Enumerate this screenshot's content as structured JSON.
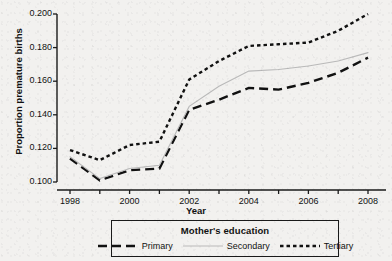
{
  "chart_data": {
    "type": "line",
    "title": "",
    "xlabel": "Year",
    "ylabel": "Proportion premature births",
    "x": [
      1998,
      1999,
      2000,
      2001,
      2002,
      2003,
      2004,
      2005,
      2006,
      2007,
      2008
    ],
    "xtick_labels": [
      "1998",
      "2000",
      "2002",
      "2004",
      "2006",
      "2008"
    ],
    "xticks_major": [
      1998,
      2000,
      2002,
      2004,
      2006,
      2008
    ],
    "xticks_minor": [
      1999,
      2001,
      2003,
      2005,
      2007
    ],
    "xlim": [
      1998,
      2008
    ],
    "ytick_labels": [
      "0.100",
      "0.120",
      "0.140",
      "0.160",
      "0.180",
      "0.200"
    ],
    "yticks": [
      0.1,
      0.12,
      0.14,
      0.16,
      0.18,
      0.2
    ],
    "ylim": [
      0.1,
      0.2
    ],
    "grid": false,
    "legend_position": "below-axis",
    "legend_title": "Mother's education",
    "series": [
      {
        "name": "Primary",
        "style": "long-dash",
        "color": "#111111",
        "values": [
          0.114,
          0.101,
          0.107,
          0.108,
          0.143,
          0.149,
          0.156,
          0.155,
          0.159,
          0.165,
          0.174
        ]
      },
      {
        "name": "Secondary",
        "style": "solid",
        "color": "#b9b9b9",
        "values": [
          0.115,
          0.102,
          0.108,
          0.11,
          0.145,
          0.157,
          0.166,
          0.167,
          0.169,
          0.172,
          0.177
        ]
      },
      {
        "name": "Tertiary",
        "style": "short-dash",
        "color": "#111111",
        "values": [
          0.119,
          0.113,
          0.122,
          0.124,
          0.161,
          0.172,
          0.181,
          0.182,
          0.183,
          0.19,
          0.2
        ]
      }
    ]
  },
  "legend": {
    "title": "Mother's education",
    "entries": [
      {
        "label": "Primary"
      },
      {
        "label": "Secondary"
      },
      {
        "label": "Tertiary"
      }
    ]
  },
  "axes": {
    "x_title": "Year",
    "y_title": "Proportion premature births"
  }
}
